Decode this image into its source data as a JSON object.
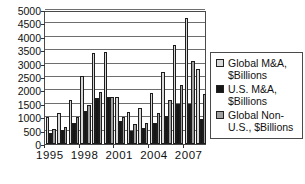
{
  "chart_data": {
    "type": "bar",
    "title": "",
    "categories": [
      "1995",
      "1996",
      "1997",
      "1998",
      "1999",
      "2000",
      "2001",
      "2002",
      "2003",
      "2004",
      "2005",
      "2006",
      "2007",
      "2008"
    ],
    "series": [
      {
        "name": "Global M&A, $Billions",
        "color": "#d8d8d8",
        "values": [
          1000,
          1150,
          1650,
          2550,
          3400,
          3450,
          1750,
          1200,
          1350,
          1900,
          2700,
          3700,
          4700,
          2800
        ]
      },
      {
        "name": "U.S. M&A, $Billions",
        "color": "#161616",
        "values": [
          400,
          525,
          800,
          1250,
          1700,
          1750,
          850,
          500,
          600,
          800,
          1050,
          1500,
          1500,
          950
        ]
      },
      {
        "name": "Global Non-U.S., $Billions",
        "color": "#a0a0a0",
        "values": [
          575,
          650,
          1000,
          1450,
          1950,
          1750,
          1000,
          750,
          800,
          1150,
          1650,
          2200,
          3100,
          1850
        ]
      }
    ],
    "xlabel": "",
    "ylabel": "",
    "ylim": [
      0,
      5000
    ],
    "ytick_step": 500,
    "y_tick_labels": [
      "0",
      "500",
      "1000",
      "1500",
      "2000",
      "2500",
      "3000",
      "3500",
      "4000",
      "4500",
      "5000"
    ],
    "x_tick_labels_shown": [
      "1995",
      "1998",
      "2001",
      "2004",
      "2007"
    ],
    "x_label_every_n_groups": 3,
    "grid": "horizontal",
    "legend_position": "right",
    "plot_background": "#ffffff",
    "gridline_color": "#6e6e6e",
    "border_color": "#4a4a4a"
  },
  "legend": {
    "items": [
      {
        "label": "Global M&A, $Billions",
        "swatch_color": "#d8d8d8"
      },
      {
        "label": "U.S. M&A, $Billions",
        "swatch_color": "#161616"
      },
      {
        "label": "Global Non-U.S., $Billions",
        "swatch_color": "#a0a0a0"
      }
    ]
  }
}
